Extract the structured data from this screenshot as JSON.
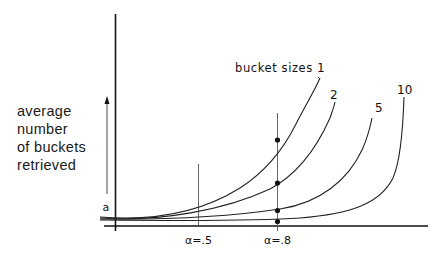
{
  "diagram": {
    "y_axis_label_lines": [
      "average",
      "number",
      "of buckets",
      "retrieved"
    ],
    "arrow_label": "a",
    "series_prefix": "bucket sizes",
    "series": [
      {
        "label": "1"
      },
      {
        "label": "2"
      },
      {
        "label": "5"
      },
      {
        "label": "10"
      }
    ],
    "x_markers": [
      {
        "label": "α=.5"
      },
      {
        "label": "α=.8"
      }
    ],
    "line_color": "#1a1a1a",
    "marker_color": "#111111"
  }
}
